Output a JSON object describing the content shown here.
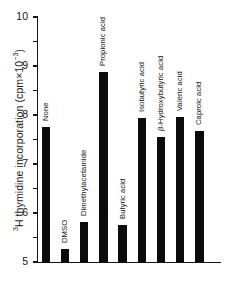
{
  "chart_data": {
    "type": "bar",
    "title": "",
    "xlabel": "",
    "ylabel": "³H thymidine incorporation (cpm×10⁻³)",
    "ylim": [
      0,
      10
    ],
    "ytick_labels": [
      "10",
      "9",
      "8",
      "7",
      "6",
      "5",
      "4",
      "3",
      "2",
      "1",
      "0"
    ],
    "ytick_values": [
      10,
      9,
      8,
      7,
      6,
      5,
      4,
      3,
      2,
      1,
      0
    ],
    "grid": false,
    "legend": "none",
    "bar_color": "#0b0b0b",
    "categories": [
      "None",
      "DMSO",
      "Dimethylacetamide",
      "Propionic acid",
      "Butyric acid",
      "Isobutyric acid",
      "β-Hydroxybutyric acid",
      "Valeric acid",
      "Caproic acid"
    ],
    "values": [
      5.5,
      0.53,
      1.63,
      7.75,
      1.5,
      5.88,
      5.1,
      5.92,
      5.35
    ]
  }
}
